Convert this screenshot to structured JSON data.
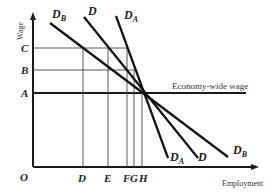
{
  "diagram": {
    "y_axis_label": "Wage",
    "x_axis_label": "Employment",
    "origin_label": "O",
    "wage_levels": [
      {
        "label": "C",
        "y": 48
      },
      {
        "label": "B",
        "y": 70
      },
      {
        "label": "A",
        "y": 93
      }
    ],
    "employment_levels": [
      {
        "label": "D",
        "x": 83
      },
      {
        "label": "E",
        "x": 108
      },
      {
        "label": "F",
        "x": 127
      },
      {
        "label": "G",
        "x": 134
      },
      {
        "label": "H",
        "x": 142
      }
    ],
    "economy_wide_wage_label": "Economy-wide wage",
    "demand_curves": [
      {
        "name": "D",
        "sub": "B",
        "top_label": "D",
        "top_sub": "B",
        "bottom_label": "D",
        "bottom_sub": "B"
      },
      {
        "name": "D",
        "sub": "",
        "top_label": "D",
        "top_sub": "",
        "bottom_label": "D",
        "bottom_sub": ""
      },
      {
        "name": "D",
        "sub": "A",
        "top_label": "D",
        "top_sub": "A",
        "bottom_label": "D",
        "bottom_sub": "A"
      }
    ]
  }
}
